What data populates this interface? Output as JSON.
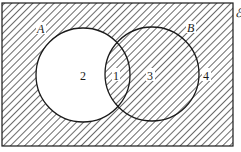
{
  "diagram": {
    "type": "venn",
    "universal_set_label": "ℰ",
    "sets": [
      {
        "id": "A",
        "label": "A"
      },
      {
        "id": "B",
        "label": "B"
      }
    ],
    "regions": [
      {
        "id": "1",
        "label": "1",
        "description": "A ∩ B",
        "shaded": true
      },
      {
        "id": "2",
        "label": "2",
        "description": "A only",
        "shaded": false
      },
      {
        "id": "3",
        "label": "3",
        "description": "B only",
        "shaded": true
      },
      {
        "id": "4",
        "label": "4",
        "description": "outside A ∪ B",
        "shaded": true
      }
    ],
    "shaded_set": "A' ∪ B",
    "colors": {
      "line": "#1a1a1a",
      "hatch": "#2a2a2a",
      "background": "#ffffff"
    }
  }
}
